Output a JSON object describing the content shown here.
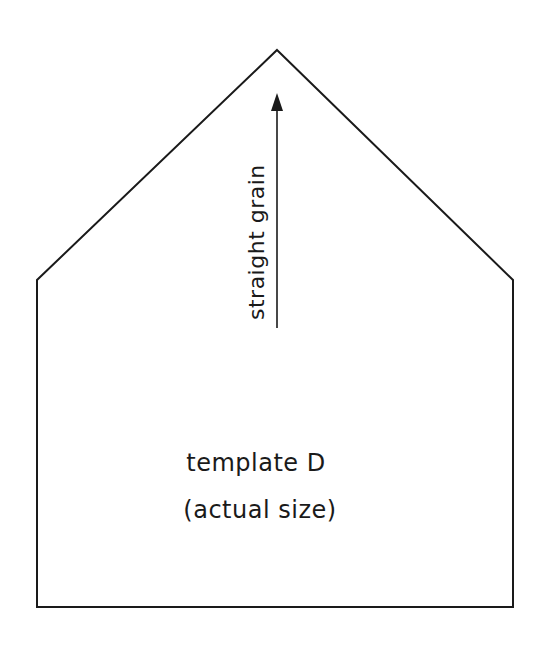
{
  "template": {
    "name": "template D",
    "subtitle": "(actual size)",
    "grain_label": "straight grain",
    "shape": "pentagon (house shape)",
    "outline_points": [
      [
        277,
        50
      ],
      [
        513,
        280
      ],
      [
        513,
        607
      ],
      [
        37,
        607
      ],
      [
        37,
        280
      ]
    ],
    "arrow": {
      "x": 277,
      "y_start": 328,
      "y_end": 94,
      "direction": "up"
    },
    "line_color": "#1a1a1a",
    "background": "#ffffff"
  }
}
